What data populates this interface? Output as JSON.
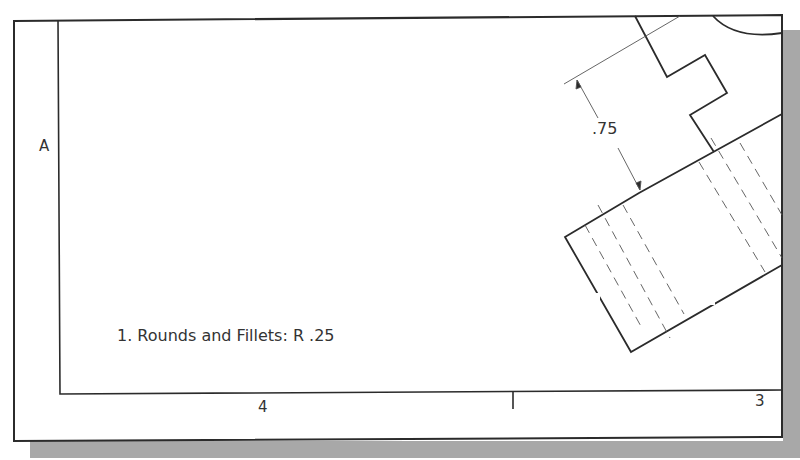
{
  "sheet": {
    "zone_labels": {
      "left_row": "A",
      "bottom_col_left": "4",
      "bottom_col_right": "3"
    },
    "dimension": {
      "value": ".75"
    },
    "notes": [
      "1. Rounds and Fillets: R .25"
    ]
  },
  "colors": {
    "line": "#2b2b2b",
    "thin_line": "#555555",
    "shadow": "#a8a8a8",
    "paper": "#ffffff"
  }
}
